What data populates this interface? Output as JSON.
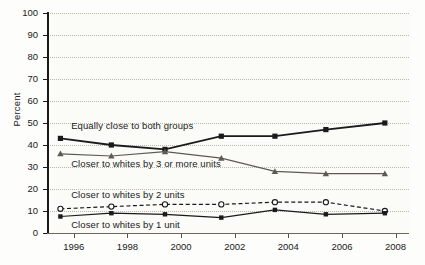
{
  "chart_data": {
    "type": "line",
    "title": "",
    "xlabel": "",
    "ylabel": "Percent",
    "xlim": [
      1995,
      2008.5
    ],
    "ylim": [
      0,
      100
    ],
    "grid": true,
    "legend_position": "inline-annotations",
    "x": [
      1995.5,
      1997.4,
      1999.4,
      2001.5,
      2003.5,
      2005.4,
      2007.6
    ],
    "xticks": [
      1996,
      1998,
      2000,
      2002,
      2004,
      2006,
      2008
    ],
    "xtick_labels": [
      "1996",
      "1998",
      "2000",
      "2002",
      "2004",
      "2006",
      "2008"
    ],
    "yticks": [
      0,
      10,
      20,
      30,
      40,
      50,
      60,
      70,
      80,
      90,
      100
    ],
    "ytick_labels": [
      "0",
      "10",
      "20",
      "30",
      "40",
      "50",
      "60",
      "70",
      "80",
      "90",
      "100"
    ],
    "series": [
      {
        "name": "Equally close to both groups",
        "values": [
          43,
          40,
          38,
          44,
          44,
          47,
          50
        ],
        "marker": "filled-square",
        "linestyle": "solid",
        "color": "#1a1a1a",
        "label_x": 1995.9,
        "label_y": 48.5
      },
      {
        "name": "Closer to whites by 3 or more units",
        "values": [
          36,
          35,
          37,
          34,
          28,
          27,
          27
        ],
        "marker": "filled-triangle",
        "linestyle": "solid",
        "color": "#5d5a52",
        "label_x": 1995.9,
        "label_y": 31.5
      },
      {
        "name": "Closer to whites by 2 units",
        "values": [
          11,
          12,
          13,
          13,
          14,
          14,
          10
        ],
        "marker": "open-circle",
        "linestyle": "dashed",
        "color": "#1a1a1a",
        "label_x": 1995.9,
        "label_y": 17.5
      },
      {
        "name": "Closer to whites by 1 unit",
        "values": [
          7.5,
          9,
          8.5,
          7,
          10.5,
          8.5,
          9
        ],
        "marker": "filled-square-small",
        "linestyle": "solid",
        "color": "#1a1a1a",
        "label_x": 1995.9,
        "label_y": 3.5
      }
    ]
  }
}
